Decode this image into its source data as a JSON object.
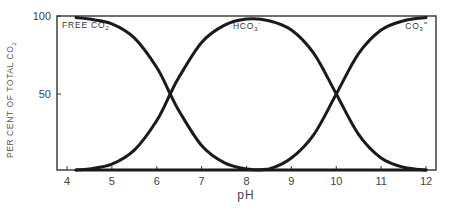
{
  "chart_data": {
    "type": "line",
    "title": "",
    "xlabel": "pH",
    "ylabel": "PER CENT OF TOTAL CO2",
    "xlim": [
      3.8,
      12.2
    ],
    "ylim": [
      0,
      100
    ],
    "x_ticks": [
      4,
      5,
      6,
      7,
      8,
      9,
      10,
      11,
      12
    ],
    "y_ticks": [
      50,
      100
    ],
    "y_tick_labels": [
      "50",
      "100"
    ],
    "grid": false,
    "legend": "inline labels",
    "x": [
      4.2,
      4.5,
      5.0,
      5.5,
      6.0,
      6.3,
      6.5,
      7.0,
      7.5,
      8.0,
      8.5,
      9.0,
      9.5,
      10.0,
      10.5,
      11.0,
      11.5,
      12.0
    ],
    "series": [
      {
        "name": "FREE CO2",
        "label_text": "FREE CO",
        "label_sub": "2",
        "values": [
          99,
          98,
          95,
          86,
          67,
          50,
          39,
          17,
          6,
          2,
          1,
          0,
          0,
          0,
          0,
          0,
          0,
          0
        ]
      },
      {
        "name": "HCO3-",
        "label_text": "HCO",
        "label_sub": "3",
        "label_sup": "-",
        "values": [
          1,
          2,
          5,
          14,
          33,
          50,
          61,
          83,
          94,
          98,
          97,
          91,
          76,
          50,
          24,
          9,
          3,
          1
        ]
      },
      {
        "name": "CO3=",
        "label_text": "CO",
        "label_sub": "3",
        "label_sup": "=",
        "values": [
          0,
          0,
          0,
          0,
          0,
          0,
          0,
          0,
          0,
          0,
          2,
          9,
          24,
          50,
          76,
          91,
          97,
          99
        ]
      }
    ]
  },
  "axis": {
    "y_axis_title": "PER CENT OF TOTAL CO",
    "y_axis_title_sub": "2",
    "x_axis_title": "pH"
  }
}
